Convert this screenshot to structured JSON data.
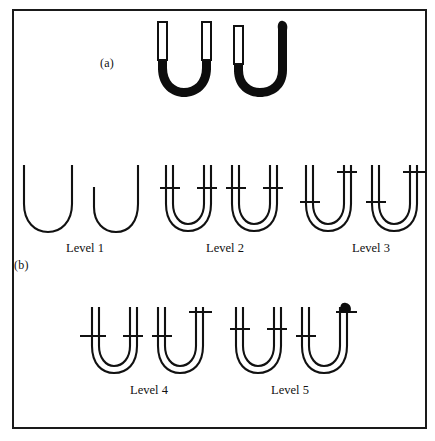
{
  "figure": {
    "background_color": "#ffffff",
    "ink_color": "#111111",
    "border_color": "#1a1a1a"
  },
  "panels": [
    {
      "id": "a",
      "label": "(a)",
      "description": "Two reference U-tube manometers drawn with solid black (filled) liquid columns"
    },
    {
      "id": "b",
      "label": "(b)",
      "description": "Student drawings of U-tube manometers grouped into five response levels"
    }
  ],
  "panel_a": {
    "tubes": [
      {
        "name": "reference-manometer-left",
        "fill": "equal-levels",
        "left_column_top": 44,
        "right_column_top": 44,
        "has_blob": false
      },
      {
        "name": "reference-manometer-right",
        "fill": "unequal-levels",
        "left_column_top": 48,
        "right_column_top": 24,
        "has_blob": true
      }
    ]
  },
  "levels": [
    {
      "id": "level-1",
      "caption": "Level 1",
      "caption_x": 84,
      "caption_y": 241,
      "tubes": [
        {
          "name": "level-1-tube-1",
          "style": "single-line",
          "left_arm_top": 164,
          "right_arm_top": 164,
          "ticks": []
        },
        {
          "name": "level-1-tube-2",
          "style": "single-line",
          "left_arm_top": 186,
          "right_arm_top": 164,
          "ticks": []
        }
      ]
    },
    {
      "id": "level-2",
      "caption": "Level 2",
      "caption_x": 224,
      "caption_y": 241,
      "tubes": [
        {
          "name": "level-2-tube-1",
          "style": "double-line",
          "left_arm_top": 164,
          "right_arm_top": 164,
          "ticks": [
            {
              "arm": "left",
              "y": 188
            },
            {
              "arm": "right",
              "y": 188
            }
          ]
        },
        {
          "name": "level-2-tube-2",
          "style": "double-line",
          "left_arm_top": 164,
          "right_arm_top": 164,
          "ticks": [
            {
              "arm": "left",
              "y": 188
            },
            {
              "arm": "right",
              "y": 188
            }
          ]
        }
      ]
    },
    {
      "id": "level-3",
      "caption": "Level 3",
      "caption_x": 371,
      "caption_y": 241,
      "tubes": [
        {
          "name": "level-3-tube-1",
          "style": "double-line",
          "left_arm_top": 164,
          "right_arm_top": 164,
          "ticks": [
            {
              "arm": "left",
              "y": 202
            },
            {
              "arm": "right",
              "y": 172
            }
          ]
        },
        {
          "name": "level-3-tube-2",
          "style": "double-line",
          "left_arm_top": 164,
          "right_arm_top": 164,
          "ticks": [
            {
              "arm": "left",
              "y": 202
            },
            {
              "arm": "right",
              "y": 172
            }
          ]
        }
      ]
    },
    {
      "id": "level-4",
      "caption": "Level 4",
      "caption_x": 148,
      "caption_y": 383,
      "tubes": [
        {
          "name": "level-4-tube-1",
          "style": "double-line",
          "left_arm_top": 306,
          "right_arm_top": 306,
          "ticks": [
            {
              "arm": "left",
              "y": 336
            },
            {
              "arm": "right",
              "y": 336
            }
          ]
        },
        {
          "name": "level-4-tube-2",
          "style": "double-line",
          "left_arm_top": 306,
          "right_arm_top": 306,
          "ticks": [
            {
              "arm": "left",
              "y": 336
            },
            {
              "arm": "right",
              "y": 312
            }
          ]
        }
      ]
    },
    {
      "id": "level-5",
      "caption": "Level 5",
      "caption_x": 289,
      "caption_y": 383,
      "tubes": [
        {
          "name": "level-5-tube-1",
          "style": "double-line",
          "left_arm_top": 306,
          "right_arm_top": 306,
          "ticks": [
            {
              "arm": "left",
              "y": 329
            },
            {
              "arm": "right",
              "y": 329
            }
          ]
        },
        {
          "name": "level-5-tube-2",
          "style": "double-line",
          "left_arm_top": 306,
          "right_arm_top": 306,
          "has_blob": true,
          "ticks": [
            {
              "arm": "left",
              "y": 336
            },
            {
              "arm": "right",
              "y": 311
            }
          ]
        }
      ]
    }
  ]
}
